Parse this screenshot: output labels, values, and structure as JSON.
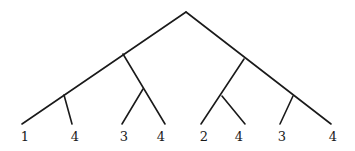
{
  "diagram": {
    "type": "tree",
    "stroke_color": "#1a1a1a",
    "background": "#ffffff",
    "nodes": {
      "root": {
        "x": 186,
        "y": 12
      },
      "left": {
        "x": 123,
        "y": 54
      },
      "right": {
        "x": 244,
        "y": 59
      },
      "left_left": {
        "x": 64,
        "y": 95
      },
      "left_right": {
        "x": 143,
        "y": 89
      },
      "right_left": {
        "x": 222,
        "y": 96
      },
      "right_right": {
        "x": 293,
        "y": 96
      }
    },
    "edges": [
      {
        "from": [
          186,
          12
        ],
        "to": [
          22,
          124
        ]
      },
      {
        "from": [
          186,
          12
        ],
        "to": [
          331,
          124
        ]
      },
      {
        "from": [
          123,
          54
        ],
        "to": [
          165,
          124
        ]
      },
      {
        "from": [
          143,
          89
        ],
        "to": [
          122,
          124
        ]
      },
      {
        "from": [
          64,
          95
        ],
        "to": [
          72,
          124
        ]
      },
      {
        "from": [
          244,
          59
        ],
        "to": [
          201,
          124
        ]
      },
      {
        "from": [
          222,
          96
        ],
        "to": [
          245,
          124
        ]
      },
      {
        "from": [
          293,
          96
        ],
        "to": [
          280,
          124
        ]
      }
    ],
    "leaves": [
      {
        "label": "1",
        "x": 25,
        "y": 141
      },
      {
        "label": "4",
        "x": 75,
        "y": 141
      },
      {
        "label": "3",
        "x": 124,
        "y": 141
      },
      {
        "label": "4",
        "x": 161,
        "y": 141
      },
      {
        "label": "2",
        "x": 204,
        "y": 141
      },
      {
        "label": "4",
        "x": 239,
        "y": 141
      },
      {
        "label": "3",
        "x": 282,
        "y": 141
      },
      {
        "label": "4",
        "x": 333,
        "y": 141
      }
    ]
  }
}
